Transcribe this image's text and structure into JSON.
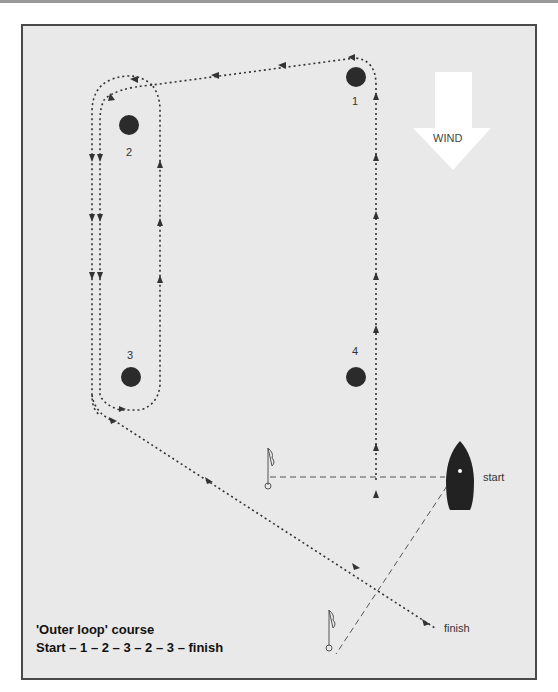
{
  "diagram": {
    "title": "'Outer loop' course",
    "sequence": "Start – 1 – 2 – 3 – 2 – 3 – finish",
    "wind_label": "WIND",
    "buoys": [
      {
        "id": "1",
        "label": "1"
      },
      {
        "id": "2",
        "label": "2"
      },
      {
        "id": "3",
        "label": "3"
      },
      {
        "id": "4",
        "label": "4"
      }
    ],
    "start_label": "start",
    "finish_label": "finish",
    "colors": {
      "background": "#e9e9e9",
      "buoy": "#2b2b2b",
      "path": "#333333",
      "wind_arrow": "#ffffff",
      "frame_border": "#4a4a4a"
    }
  }
}
